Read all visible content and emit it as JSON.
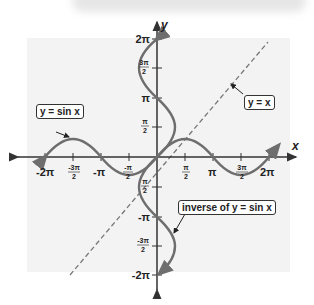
{
  "figure": {
    "axes": {
      "x_label": "x",
      "y_label": "y"
    },
    "x_ticks": [
      "-2π",
      "-3π/2",
      "-π",
      "-π/2",
      "π/2",
      "π",
      "3π/2",
      "2π"
    ],
    "y_ticks": [
      "2π",
      "3π/2",
      "π",
      "π/2",
      "-π/2",
      "-π",
      "-3π/2",
      "-2π"
    ],
    "callouts": {
      "sin": "y = sin x",
      "identity": "y = x",
      "inverse": "inverse of y = sin x"
    },
    "colors": {
      "curve": "#6e6e6e",
      "axis": "#333333",
      "dashed_line": "#777777",
      "plot_background": "#f3f3f3"
    },
    "curves": [
      {
        "name": "y = sin x",
        "domain": "[-2π, 2π]",
        "style": "solid"
      },
      {
        "name": "inverse of y = sin x",
        "relation": "x = sin y",
        "range": "[-2π, 2π]",
        "style": "solid"
      },
      {
        "name": "y = x",
        "style": "dashed"
      }
    ]
  }
}
